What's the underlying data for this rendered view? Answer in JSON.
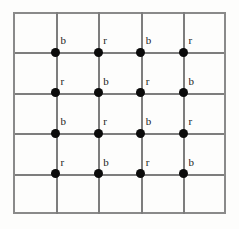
{
  "figure": {
    "type": "lattice-grid-diagram",
    "title": "",
    "background_color": "#fdfdfc",
    "grid": {
      "columns": 5,
      "rows": 5,
      "line_color": "#7d7d7d",
      "border_color": "#8a8a8a",
      "cell_width": 42.6,
      "cell_height": 40.4,
      "origin_x": 13,
      "origin_y": 12,
      "width": 213,
      "height": 202
    },
    "node_style": {
      "shape": "filled-circle",
      "color": "#0b0b0b",
      "diameter": 9
    },
    "label_style": {
      "color": "#1a1a1a",
      "font_size": 11,
      "offset_x": 5,
      "offset_y": -17
    },
    "nodes": [
      {
        "row": 1,
        "col": 1,
        "x": 42.6,
        "y": 40.4,
        "label": "b"
      },
      {
        "row": 1,
        "col": 2,
        "x": 85.2,
        "y": 40.4,
        "label": "r"
      },
      {
        "row": 1,
        "col": 3,
        "x": 127.8,
        "y": 40.4,
        "label": "b"
      },
      {
        "row": 1,
        "col": 4,
        "x": 170.4,
        "y": 40.4,
        "label": "r"
      },
      {
        "row": 2,
        "col": 1,
        "x": 42.6,
        "y": 80.8,
        "label": "r"
      },
      {
        "row": 2,
        "col": 2,
        "x": 85.2,
        "y": 80.8,
        "label": "b"
      },
      {
        "row": 2,
        "col": 3,
        "x": 127.8,
        "y": 80.8,
        "label": "r"
      },
      {
        "row": 2,
        "col": 4,
        "x": 170.4,
        "y": 80.8,
        "label": "b"
      },
      {
        "row": 3,
        "col": 1,
        "x": 42.6,
        "y": 121.2,
        "label": "b"
      },
      {
        "row": 3,
        "col": 2,
        "x": 85.2,
        "y": 121.2,
        "label": "r"
      },
      {
        "row": 3,
        "col": 3,
        "x": 127.8,
        "y": 121.2,
        "label": "b"
      },
      {
        "row": 3,
        "col": 4,
        "x": 170.4,
        "y": 121.2,
        "label": "r"
      },
      {
        "row": 4,
        "col": 1,
        "x": 42.6,
        "y": 161.6,
        "label": "r"
      },
      {
        "row": 4,
        "col": 2,
        "x": 85.2,
        "y": 161.6,
        "label": "b"
      },
      {
        "row": 4,
        "col": 3,
        "x": 127.8,
        "y": 161.6,
        "label": "r"
      },
      {
        "row": 4,
        "col": 4,
        "x": 170.4,
        "y": 161.6,
        "label": "b"
      }
    ],
    "horizontal_lines": [
      0,
      40.4,
      80.8,
      121.2,
      161.6,
      200
    ],
    "vertical_lines": [
      0,
      42.6,
      85.2,
      127.8,
      170.4,
      211
    ]
  }
}
